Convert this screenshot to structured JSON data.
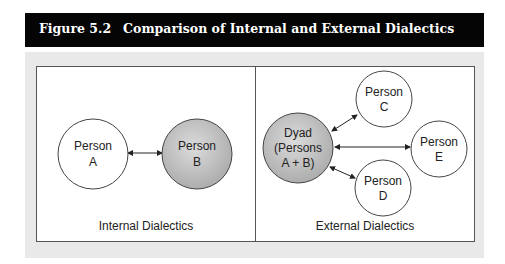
{
  "figure": {
    "number": "Figure 5.2",
    "title": "Comparison of Internal and External Dialectics"
  },
  "panels": {
    "internal": {
      "caption": "Internal Dialectics",
      "nodes": [
        {
          "id": "A",
          "line1": "Person",
          "line2": "A",
          "fill": "white"
        },
        {
          "id": "B",
          "line1": "Person",
          "line2": "B",
          "fill": "gray"
        }
      ],
      "edges": [
        {
          "from": "A",
          "to": "B",
          "bidirectional": true
        }
      ]
    },
    "external": {
      "caption": "External Dialectics",
      "nodes": [
        {
          "id": "Dyad",
          "line1": "Dyad",
          "line2": "(Persons",
          "line3": "A + B)",
          "fill": "gray"
        },
        {
          "id": "C",
          "line1": "Person",
          "line2": "C",
          "fill": "white"
        },
        {
          "id": "E",
          "line1": "Person",
          "line2": "E",
          "fill": "white"
        },
        {
          "id": "D",
          "line1": "Person",
          "line2": "D",
          "fill": "white"
        }
      ],
      "edges": [
        {
          "from": "Dyad",
          "to": "C",
          "bidirectional": true
        },
        {
          "from": "Dyad",
          "to": "E",
          "bidirectional": true
        },
        {
          "from": "Dyad",
          "to": "D",
          "bidirectional": true
        }
      ]
    }
  },
  "colors": {
    "title_bg": "#050505",
    "title_text": "#ffffff",
    "figure_bg": "#e9e9e9",
    "panel_bg": "#ffffff",
    "node_white": "#ffffff",
    "node_gray": "#bdbdbd",
    "stroke": "#333333"
  }
}
